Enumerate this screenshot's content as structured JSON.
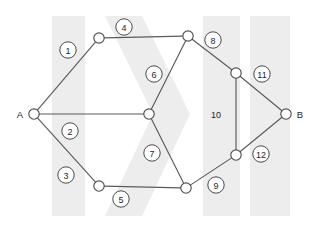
{
  "diagram": {
    "canvas": {
      "width": 320,
      "height": 229
    },
    "background_color": "#ffffff",
    "line_color": "#5b5b5b",
    "watermark_color": "#ededed",
    "terminals": [
      {
        "id": "A",
        "label": "A",
        "label_x": 20,
        "label_y": 114,
        "x": 34,
        "y": 114
      },
      {
        "id": "B",
        "label": "B",
        "label_x": 300,
        "label_y": 114,
        "x": 286,
        "y": 114
      }
    ],
    "nodes": [
      {
        "id": "A",
        "x": 34,
        "y": 114,
        "r": 5.2
      },
      {
        "id": "C",
        "x": 99,
        "y": 38,
        "r": 5.2
      },
      {
        "id": "D",
        "x": 188,
        "y": 36,
        "r": 5.2
      },
      {
        "id": "E",
        "x": 149,
        "y": 114,
        "r": 5.2
      },
      {
        "id": "F",
        "x": 99,
        "y": 186,
        "r": 5.2
      },
      {
        "id": "G",
        "x": 186,
        "y": 188,
        "r": 5.2
      },
      {
        "id": "H",
        "x": 236,
        "y": 73,
        "r": 5.2
      },
      {
        "id": "I",
        "x": 236,
        "y": 155,
        "r": 5.2
      },
      {
        "id": "B",
        "x": 286,
        "y": 114,
        "r": 5.2
      }
    ],
    "edges": [
      {
        "id": "e1",
        "from": "A",
        "to": "C",
        "label": "1",
        "label_style": "circled",
        "label_x": 68,
        "label_y": 50
      },
      {
        "id": "e2",
        "from": "A",
        "to": "E",
        "label": "2",
        "label_style": "circled",
        "label_x": 70,
        "label_y": 131
      },
      {
        "id": "e3",
        "from": "A",
        "to": "F",
        "label": "3",
        "label_style": "circled",
        "label_x": 66,
        "label_y": 175
      },
      {
        "id": "e4",
        "from": "C",
        "to": "D",
        "label": "4",
        "label_style": "circled",
        "label_x": 124,
        "label_y": 27
      },
      {
        "id": "e5",
        "from": "F",
        "to": "G",
        "label": "5",
        "label_style": "circled",
        "label_x": 121,
        "label_y": 199
      },
      {
        "id": "e6",
        "from": "D",
        "to": "E",
        "label": "6",
        "label_style": "circled",
        "label_x": 154,
        "label_y": 74
      },
      {
        "id": "e7",
        "from": "E",
        "to": "G",
        "label": "7",
        "label_style": "circled",
        "label_x": 152,
        "label_y": 153
      },
      {
        "id": "e8",
        "from": "D",
        "to": "H",
        "label": "8",
        "label_style": "circled",
        "label_x": 213,
        "label_y": 40
      },
      {
        "id": "e9",
        "from": "G",
        "to": "I",
        "label": "9",
        "label_style": "circled",
        "label_x": 216,
        "label_y": 185
      },
      {
        "id": "e10",
        "from": "H",
        "to": "I",
        "label": "10",
        "label_style": "plain",
        "label_x": 216,
        "label_y": 114
      },
      {
        "id": "e11",
        "from": "H",
        "to": "B",
        "label": "11",
        "label_style": "circled",
        "label_x": 262,
        "label_y": 74
      },
      {
        "id": "e12",
        "from": "I",
        "to": "B",
        "label": "12",
        "label_style": "circled",
        "label_x": 261,
        "label_y": 154
      }
    ],
    "watermark_bands": [
      {
        "id": "band-1",
        "x": 52,
        "y": 16,
        "width": 33,
        "height": 200
      },
      {
        "id": "band-2",
        "x": 203,
        "y": 16,
        "width": 37,
        "height": 200
      },
      {
        "id": "band-3",
        "x": 250,
        "y": 16,
        "width": 40,
        "height": 200
      }
    ],
    "watermark_chevron": {
      "id": "chevron",
      "points": "105,16 142,16 190,114 142,216 105,216 153,114"
    }
  }
}
